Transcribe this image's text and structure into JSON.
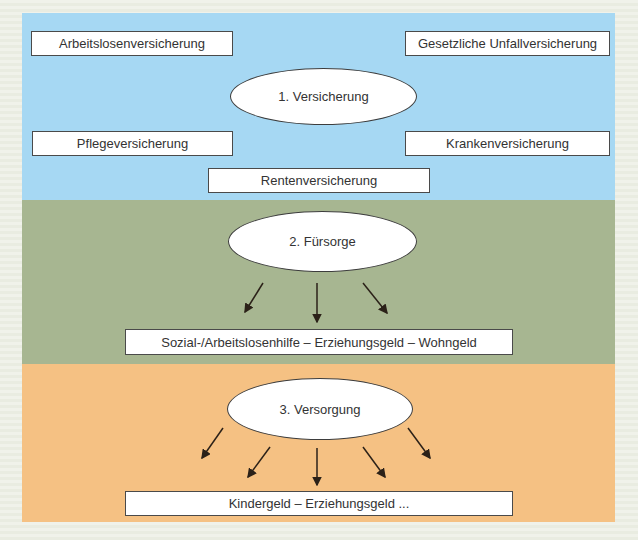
{
  "diagram_name": "Soziale Sicherung",
  "colors": {
    "band_versicherung": "#a6d8f3",
    "band_fuersorge": "#a7b691",
    "band_versorgung": "#f5c183",
    "page_background": "#eef1e8",
    "box_background": "#ffffff",
    "outline": "#4a4a4a",
    "arrow": "#2b2118"
  },
  "bands": {
    "versicherung": {
      "ellipse_label": "1. Versicherung",
      "box_arbeitslosen": "Arbeitslosenversicherung",
      "box_unfall": "Gesetzliche Unfallversicherung",
      "box_pflege": "Pflegeversicherung",
      "box_kranken": "Krankenversicherung",
      "box_renten": "Rentenversicherung",
      "color": "#a6d8f3"
    },
    "fuersorge": {
      "ellipse_label": "2. Fürsorge",
      "box_leistungen": "Sozial-/Arbeitslosenhilfe – Erziehungsgeld – Wohngeld",
      "arrow_count": 3,
      "color": "#a7b691"
    },
    "versorgung": {
      "ellipse_label": "3. Versorgung",
      "box_leistungen": "Kindergeld – Erziehungsgeld ...",
      "arrow_count": 5,
      "color": "#f5c183"
    }
  }
}
